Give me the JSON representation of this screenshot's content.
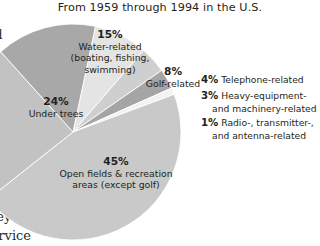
{
  "chart_data": {
    "type": "pie",
    "title": "From 1959 through 1994 in the U.S.",
    "categories": [
      "Open fields & recreation areas (except golf)",
      "Under trees",
      "Water-related (boating, fishing, swimming)",
      "Golf-related",
      "Telephone-related",
      "Heavy-equipment- and machinery-related",
      "Radio-, transmitter-, and antenna-related"
    ],
    "values": [
      45,
      24,
      15,
      8,
      4,
      3,
      1
    ],
    "value_unit": "%",
    "legend_position": "right",
    "grid": false,
    "xlabel": "",
    "ylabel": "",
    "slices": [
      {
        "pct": "45%",
        "label_line1": "Open fields & recreation",
        "label_line2": "areas (except golf)",
        "value": 45,
        "color": "#c9c9c9",
        "label_placement": "inside"
      },
      {
        "pct": "24%",
        "label_line1": "Under trees",
        "label_line2": "",
        "value": 24,
        "color": "#c2c2c2",
        "label_placement": "inside"
      },
      {
        "pct": "15%",
        "label_line1": "Water-related",
        "label_line2": "(boating, fishing,",
        "label_line3": "swimming)",
        "value": 15,
        "color": "#a8a8a8",
        "label_placement": "inside"
      },
      {
        "pct": "8%",
        "label_line1": "Golf-related",
        "label_line2": "",
        "value": 8,
        "color": "#e4e4e4",
        "label_placement": "inside"
      },
      {
        "pct": "4%",
        "label_line1": "Telephone-related",
        "label_line2": "",
        "value": 4,
        "color": "#cfcfcf",
        "label_placement": "legend"
      },
      {
        "pct": "3%",
        "label_line1": "Heavy-equipment-",
        "label_line2": "and machinery-related",
        "value": 3,
        "color": "#a5a5a5",
        "label_placement": "legend"
      },
      {
        "pct": "1%",
        "label_line1": "Radio-, transmitter-,",
        "label_line2": "and antenna-related",
        "value": 1,
        "color": "#f2f2f2",
        "label_placement": "legend"
      }
    ]
  },
  "header": {
    "title": "From 1959 through 1994 in the U.S."
  },
  "pie_labels": {
    "water": {
      "pct": "15%",
      "line1": "Water-related",
      "line2": "(boating, fishing,",
      "line3": "swimming)"
    },
    "golf": {
      "pct": "8%",
      "line1": "Golf-related"
    },
    "trees": {
      "pct": "24%",
      "line1": "Under trees"
    },
    "open": {
      "pct": "45%",
      "line1": "Open fields & recreation",
      "line2": "areas (except golf)"
    }
  },
  "legend": {
    "telephone": {
      "pct": "4%",
      "label": "Telephone-related"
    },
    "heavy": {
      "pct": "3%",
      "label": "Heavy-equipment- and machinery-related"
    },
    "radio": {
      "pct": "1%",
      "label": "Radio-, transmitter-, and antenna-related"
    }
  },
  "gutter_text": {
    "frag_a": "nd",
    "frag_b": "s",
    "frag_c": "hey",
    "frag_d": "service"
  },
  "colors": {
    "background": "#ffffff",
    "text": "#231f20",
    "slice_open_fields": "#c9c9c9",
    "slice_under_trees": "#c2c2c2",
    "slice_water": "#a8a8a8",
    "slice_golf": "#e4e4e4",
    "slice_telephone": "#cfcfcf",
    "slice_heavy": "#a5a5a5",
    "slice_radio": "#f2f2f2"
  }
}
